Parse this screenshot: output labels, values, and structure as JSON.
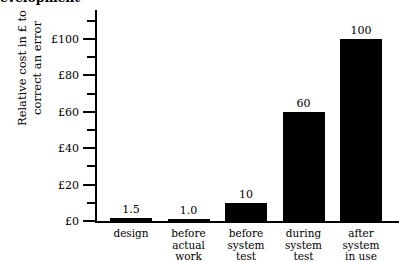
{
  "chart_data": {
    "type": "bar",
    "title": "evelopment",
    "title_note": "top of title cropped off above image edge",
    "categories": [
      "design",
      "before actual work",
      "before system test",
      "during system test",
      "after system in use"
    ],
    "category_lines": [
      [
        "design"
      ],
      [
        "before",
        "actual",
        "work"
      ],
      [
        "before",
        "system",
        "test"
      ],
      [
        "during",
        "system",
        "test"
      ],
      [
        "after",
        "system",
        "in use"
      ]
    ],
    "values": [
      1.5,
      1.0,
      10,
      60,
      100
    ],
    "value_labels": [
      "1.5",
      "1.0",
      "10",
      "60",
      "100"
    ],
    "xlabel": "",
    "ylabel_lines": [
      "Relative cost in £ to",
      "correct an error"
    ],
    "ylabel": "Relative cost in £ to correct an error",
    "ylim": [
      0,
      116
    ],
    "ytick_values": [
      0,
      20,
      40,
      60,
      80,
      100
    ],
    "ytick_labels": [
      "£0",
      "£20",
      "£40",
      "£60",
      "£80",
      "£100"
    ],
    "yminor_values": [
      10,
      30,
      50,
      70,
      90,
      110
    ],
    "grid": false,
    "legend": false,
    "bar_color": "#000000",
    "background_color": "#ffffff",
    "axis_color": "#000000"
  }
}
